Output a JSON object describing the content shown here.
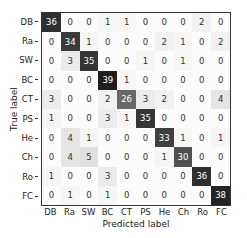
{
  "chart_data": {
    "type": "heatmap",
    "title": "",
    "xlabel": "Predicted label",
    "ylabel": "True label",
    "colormap": "Greys",
    "x_categories": [
      "DB",
      "Ra",
      "SW",
      "BC",
      "CT",
      "PS",
      "He",
      "Ch",
      "Ro",
      "FC"
    ],
    "y_categories": [
      "DB",
      "Ra",
      "SW",
      "BC",
      "CT",
      "PS",
      "He",
      "Ch",
      "Ro",
      "FC"
    ],
    "matrix": [
      [
        36,
        0,
        0,
        1,
        1,
        0,
        0,
        0,
        2,
        0
      ],
      [
        0,
        34,
        1,
        0,
        0,
        0,
        2,
        1,
        0,
        2
      ],
      [
        0,
        3,
        35,
        0,
        0,
        1,
        0,
        1,
        0,
        0
      ],
      [
        0,
        0,
        0,
        39,
        1,
        0,
        0,
        0,
        0,
        0
      ],
      [
        3,
        0,
        0,
        2,
        26,
        3,
        2,
        0,
        0,
        4
      ],
      [
        1,
        0,
        0,
        3,
        1,
        35,
        0,
        0,
        0,
        0
      ],
      [
        0,
        4,
        1,
        0,
        0,
        0,
        33,
        1,
        0,
        1
      ],
      [
        0,
        4,
        5,
        0,
        0,
        0,
        1,
        30,
        0,
        0
      ],
      [
        1,
        0,
        0,
        3,
        0,
        0,
        0,
        0,
        36,
        0
      ],
      [
        0,
        1,
        0,
        1,
        0,
        0,
        0,
        0,
        0,
        38
      ]
    ],
    "value_range": [
      0,
      39
    ],
    "grid": false,
    "legend": "none"
  },
  "axes": {
    "xlabel": "Predicted label",
    "ylabel": "True label"
  }
}
